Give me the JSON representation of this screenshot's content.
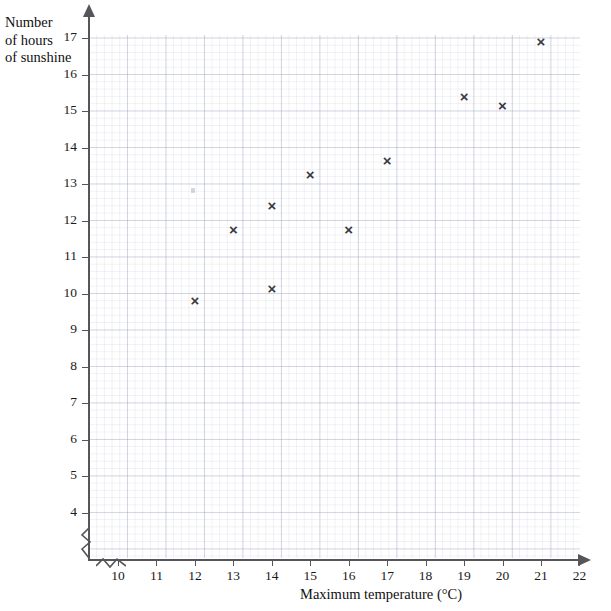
{
  "chart_data": {
    "type": "scatter",
    "title": "",
    "xlabel": "Maximum temperature (°C)",
    "ylabel": "Number of hours of sunshine",
    "ylabel_lines": [
      "Number",
      "of hours",
      "of sunshine"
    ],
    "xlim": [
      9.25,
      22.4
    ],
    "ylim": [
      3.45,
      17.35
    ],
    "x_ticks": [
      10,
      11,
      12,
      13,
      14,
      15,
      16,
      17,
      18,
      19,
      20,
      21,
      22
    ],
    "y_ticks": [
      4,
      5,
      6,
      7,
      8,
      9,
      10,
      11,
      12,
      13,
      14,
      15,
      16,
      17
    ],
    "x_tick_labels": [
      "10",
      "11",
      "12",
      "13",
      "14",
      "15",
      "16",
      "17",
      "18",
      "19",
      "20",
      "21",
      "22"
    ],
    "y_tick_labels": [
      "4",
      "5",
      "6",
      "7",
      "8",
      "9",
      "10",
      "11",
      "12",
      "13",
      "14",
      "15",
      "16",
      "17"
    ],
    "grid": true,
    "grid_minor": true,
    "legend": "none",
    "axis_break_x": true,
    "axis_break_y": true,
    "marker": "x",
    "marker_glyph": "×",
    "marker_color": "#3a3a40",
    "grid_color": "#969bb9",
    "axis_color": "#55555a",
    "points": [
      {
        "x": 12,
        "y": 9.8
      },
      {
        "x": 13,
        "y": 11.75
      },
      {
        "x": 14,
        "y": 10.15
      },
      {
        "x": 14,
        "y": 12.4
      },
      {
        "x": 15,
        "y": 13.25
      },
      {
        "x": 16,
        "y": 11.75
      },
      {
        "x": 17,
        "y": 13.65
      },
      {
        "x": 19,
        "y": 15.4
      },
      {
        "x": 20,
        "y": 15.15
      },
      {
        "x": 21,
        "y": 16.9
      }
    ]
  }
}
